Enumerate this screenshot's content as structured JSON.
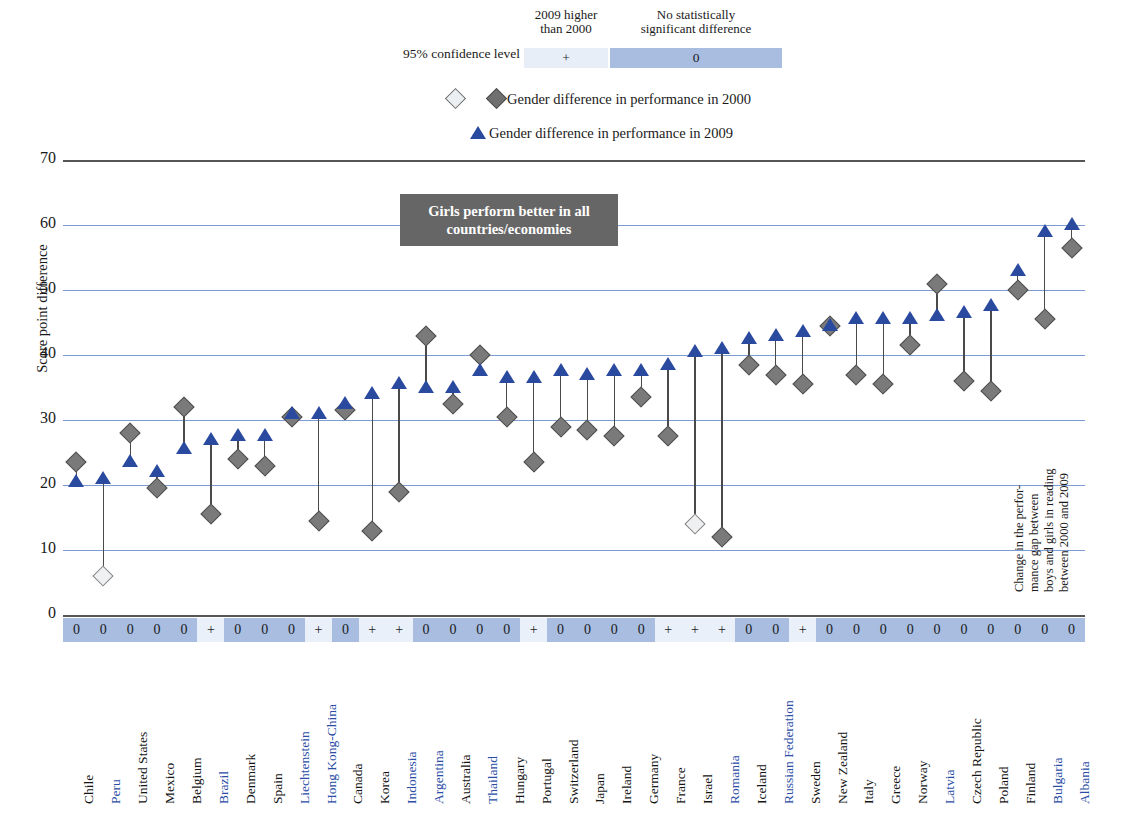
{
  "legend": {
    "confidence_label": "95% confidence level",
    "head_plus": "2009 higher\nthan 2000",
    "head_zero": "No statistically\nsignificant difference",
    "swatch_plus": "+",
    "swatch_zero": "0",
    "series_2000": "Gender difference in performance in 2000",
    "series_2009": "Gender difference in performance in 2009"
  },
  "axis": {
    "y_title": "Score point difference",
    "y_min": 0,
    "y_max": 70,
    "y_ticks": [
      70,
      60,
      50,
      40,
      30,
      20,
      10,
      0
    ]
  },
  "callout": "Girls perform better in all countries/economies",
  "right_note": "Change in the perfor-\nmance gap between\nboys and girls in reading\nbetween 2000 and 2009",
  "chart_data": {
    "type": "scatter",
    "title": "Girls perform better in all countries/economies",
    "xlabel": "",
    "ylabel": "Score point difference",
    "ylim": [
      0,
      70
    ],
    "grid": true,
    "legend_position": "top",
    "series": [
      {
        "name": "Gender difference in performance in 2000",
        "values": [
          23.5,
          6.0,
          28.0,
          19.5,
          32.0,
          15.5,
          24.0,
          23.0,
          30.5,
          14.5,
          31.5,
          13.0,
          19.0,
          43.0,
          32.5,
          40.0,
          30.5,
          23.5,
          29.0,
          28.5,
          27.5,
          33.5,
          27.5,
          14.0,
          12.0,
          38.5,
          37.0,
          35.5,
          44.5,
          37.0,
          35.5,
          41.5,
          51.0,
          36.0,
          34.5,
          50.0,
          45.5,
          56.5
        ]
      },
      {
        "name": "Gender difference in performance in 2009",
        "values": [
          20.5,
          21.0,
          23.5,
          22.0,
          25.5,
          27.0,
          27.5,
          27.5,
          31.0,
          31.0,
          32.5,
          34.0,
          35.5,
          35.0,
          35.0,
          37.5,
          36.5,
          36.5,
          37.5,
          37.0,
          37.5,
          37.5,
          38.5,
          40.5,
          41.0,
          42.5,
          43.0,
          43.5,
          44.5,
          45.5,
          45.5,
          45.5,
          46.0,
          46.5,
          47.5,
          53.0,
          59.0,
          60.0
        ]
      }
    ],
    "categories": [
      "Chile",
      "Peru",
      "United States",
      "Mexico",
      "Belgium",
      "Brazil",
      "Denmark",
      "Spain",
      "Liechtenstein",
      "Hong Kong-China",
      "Canada",
      "Korea",
      "Indonesia",
      "Argentina",
      "Australia",
      "Thailand",
      "Hungary",
      "Portugal",
      "Switzerland",
      "Japan",
      "Ireland",
      "Germany",
      "France",
      "Israel",
      "Romania",
      "Iceland",
      "Russian Federation",
      "Sweden",
      "New Zealand",
      "Italy",
      "Greece",
      "Norway",
      "Latvia",
      "Czech Republic",
      "Poland",
      "Finland",
      "Bulgaria",
      "Albania"
    ],
    "points": [
      {
        "country": "Chile",
        "v2000": 23.5,
        "v2009": 20.5,
        "open_2000": false,
        "sig": "0",
        "partner": false
      },
      {
        "country": "Peru",
        "v2000": 6.0,
        "v2009": 21.0,
        "open_2000": true,
        "sig": "0",
        "partner": true
      },
      {
        "country": "United States",
        "v2000": 28.0,
        "v2009": 23.5,
        "open_2000": false,
        "sig": "0",
        "partner": false
      },
      {
        "country": "Mexico",
        "v2000": 19.5,
        "v2009": 22.0,
        "open_2000": false,
        "sig": "0",
        "partner": false
      },
      {
        "country": "Belgium",
        "v2000": 32.0,
        "v2009": 25.5,
        "open_2000": false,
        "sig": "0",
        "partner": false
      },
      {
        "country": "Brazil",
        "v2000": 15.5,
        "v2009": 27.0,
        "open_2000": false,
        "sig": "+",
        "partner": true
      },
      {
        "country": "Denmark",
        "v2000": 24.0,
        "v2009": 27.5,
        "open_2000": false,
        "sig": "0",
        "partner": false
      },
      {
        "country": "Spain",
        "v2000": 23.0,
        "v2009": 27.5,
        "open_2000": false,
        "sig": "0",
        "partner": false
      },
      {
        "country": "Liechtenstein",
        "v2000": 30.5,
        "v2009": 31.0,
        "open_2000": false,
        "sig": "0",
        "partner": true
      },
      {
        "country": "Hong Kong-China",
        "v2000": 14.5,
        "v2009": 31.0,
        "open_2000": false,
        "sig": "+",
        "partner": true
      },
      {
        "country": "Canada",
        "v2000": 31.5,
        "v2009": 32.5,
        "open_2000": false,
        "sig": "0",
        "partner": false
      },
      {
        "country": "Korea",
        "v2000": 13.0,
        "v2009": 34.0,
        "open_2000": false,
        "sig": "+",
        "partner": false
      },
      {
        "country": "Indonesia",
        "v2000": 19.0,
        "v2009": 35.5,
        "open_2000": false,
        "sig": "+",
        "partner": true
      },
      {
        "country": "Argentina",
        "v2000": 43.0,
        "v2009": 35.0,
        "open_2000": false,
        "sig": "0",
        "partner": true
      },
      {
        "country": "Australia",
        "v2000": 32.5,
        "v2009": 35.0,
        "open_2000": false,
        "sig": "0",
        "partner": false
      },
      {
        "country": "Thailand",
        "v2000": 40.0,
        "v2009": 37.5,
        "open_2000": false,
        "sig": "0",
        "partner": true
      },
      {
        "country": "Hungary",
        "v2000": 30.5,
        "v2009": 36.5,
        "open_2000": false,
        "sig": "0",
        "partner": false
      },
      {
        "country": "Portugal",
        "v2000": 23.5,
        "v2009": 36.5,
        "open_2000": false,
        "sig": "+",
        "partner": false
      },
      {
        "country": "Switzerland",
        "v2000": 29.0,
        "v2009": 37.5,
        "open_2000": false,
        "sig": "0",
        "partner": false
      },
      {
        "country": "Japan",
        "v2000": 28.5,
        "v2009": 37.0,
        "open_2000": false,
        "sig": "0",
        "partner": false
      },
      {
        "country": "Ireland",
        "v2000": 27.5,
        "v2009": 37.5,
        "open_2000": false,
        "sig": "0",
        "partner": false
      },
      {
        "country": "Germany",
        "v2000": 33.5,
        "v2009": 37.5,
        "open_2000": false,
        "sig": "0",
        "partner": false
      },
      {
        "country": "France",
        "v2000": 27.5,
        "v2009": 38.5,
        "open_2000": false,
        "sig": "+",
        "partner": false
      },
      {
        "country": "Israel",
        "v2000": 14.0,
        "v2009": 40.5,
        "open_2000": true,
        "sig": "+",
        "partner": false
      },
      {
        "country": "Romania",
        "v2000": 12.0,
        "v2009": 41.0,
        "open_2000": false,
        "sig": "+",
        "partner": true
      },
      {
        "country": "Iceland",
        "v2000": 38.5,
        "v2009": 42.5,
        "open_2000": false,
        "sig": "0",
        "partner": false
      },
      {
        "country": "Russian Federation",
        "v2000": 37.0,
        "v2009": 43.0,
        "open_2000": false,
        "sig": "0",
        "partner": true
      },
      {
        "country": "Sweden",
        "v2000": 35.5,
        "v2009": 43.5,
        "open_2000": false,
        "sig": "+",
        "partner": false
      },
      {
        "country": "New Zealand",
        "v2000": 44.5,
        "v2009": 44.5,
        "open_2000": false,
        "sig": "0",
        "partner": false
      },
      {
        "country": "Italy",
        "v2000": 37.0,
        "v2009": 45.5,
        "open_2000": false,
        "sig": "0",
        "partner": false
      },
      {
        "country": "Greece",
        "v2000": 35.5,
        "v2009": 45.5,
        "open_2000": false,
        "sig": "0",
        "partner": false
      },
      {
        "country": "Norway",
        "v2000": 41.5,
        "v2009": 45.5,
        "open_2000": false,
        "sig": "0",
        "partner": false
      },
      {
        "country": "Latvia",
        "v2000": 51.0,
        "v2009": 46.0,
        "open_2000": false,
        "sig": "0",
        "partner": true
      },
      {
        "country": "Czech Republic",
        "v2000": 36.0,
        "v2009": 46.5,
        "open_2000": false,
        "sig": "0",
        "partner": false
      },
      {
        "country": "Poland",
        "v2000": 34.5,
        "v2009": 47.5,
        "open_2000": false,
        "sig": "0",
        "partner": false
      },
      {
        "country": "Finland",
        "v2000": 50.0,
        "v2009": 53.0,
        "open_2000": false,
        "sig": "0",
        "partner": false
      },
      {
        "country": "Bulgaria",
        "v2000": 45.5,
        "v2009": 59.0,
        "open_2000": false,
        "sig": "0",
        "partner": true
      },
      {
        "country": "Albania",
        "v2000": 56.5,
        "v2009": 60.0,
        "open_2000": false,
        "sig": "0",
        "partner": true
      }
    ]
  },
  "colors": {
    "triangle_2009": "#2a4aa0",
    "diamond_2000": "#7a7a7a",
    "gridline": "#7d9cd4",
    "sig_zero_bg": "#a8bde0",
    "sig_plus_bg": "#eaf0f9",
    "callout_bg": "#666666",
    "partner_label": "#2b4da6"
  }
}
